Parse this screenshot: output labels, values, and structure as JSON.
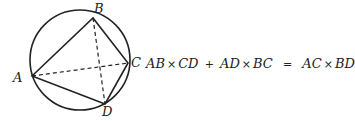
{
  "diagram": {
    "circle": {
      "cx": 96,
      "cy": 60,
      "r": 66
    },
    "points": {
      "A": {
        "label": "A",
        "x": 32,
        "y": 76
      },
      "B": {
        "label": "B",
        "x": 93,
        "y": 18
      },
      "C": {
        "label": "C",
        "x": 128,
        "y": 63
      },
      "D": {
        "label": "D",
        "x": 105,
        "y": 104
      }
    },
    "edges_solid": [
      "AB",
      "BC",
      "CD",
      "DA"
    ],
    "edges_dashed": [
      "AC",
      "BD"
    ]
  },
  "formula": {
    "t1": "AB",
    "x1": "×",
    "t2": "CD",
    "plus": "+",
    "t3": "AD",
    "x2": "×",
    "t4": "BC",
    "eq": "=",
    "t5": "AC",
    "x3": "×",
    "t6": "BD"
  }
}
